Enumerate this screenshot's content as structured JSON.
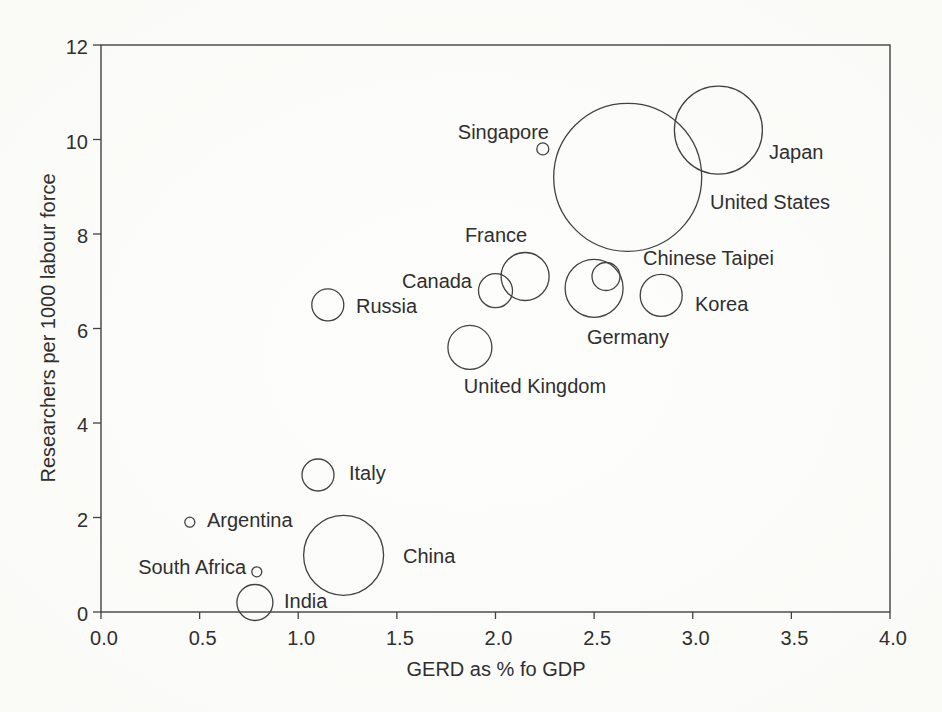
{
  "chart_data": {
    "type": "scatter",
    "variant": "bubble",
    "title": "",
    "xlabel": "GERD as % fo GDP",
    "ylabel": "Researchers per 1000 labour force",
    "xlim": [
      0.0,
      4.0
    ],
    "ylim": [
      0,
      12
    ],
    "grid": false,
    "legend": "none",
    "frame": true,
    "colors": {
      "stroke": "#424242",
      "text": "#2f2f2f",
      "background": "#fcfcfa"
    },
    "x_ticks": [
      {
        "v": 0.0,
        "label": "0.0"
      },
      {
        "v": 0.5,
        "label": "0.5"
      },
      {
        "v": 1.0,
        "label": "1.0"
      },
      {
        "v": 1.5,
        "label": "1.5"
      },
      {
        "v": 2.0,
        "label": "2.0"
      },
      {
        "v": 2.5,
        "label": "2.5"
      },
      {
        "v": 3.0,
        "label": "3.0"
      },
      {
        "v": 3.5,
        "label": "3.5"
      },
      {
        "v": 4.0,
        "label": "4.0"
      }
    ],
    "y_ticks": [
      {
        "v": 0,
        "label": "0"
      },
      {
        "v": 2,
        "label": "2"
      },
      {
        "v": 4,
        "label": "4"
      },
      {
        "v": 6,
        "label": "6"
      },
      {
        "v": 8,
        "label": "8"
      },
      {
        "v": 10,
        "label": "10"
      },
      {
        "v": 12,
        "label": "12"
      }
    ],
    "points": [
      {
        "name": "South Africa",
        "x": 0.79,
        "y": 0.85,
        "r_px": 5,
        "label_anchor": "end",
        "label_px": [
          246,
          567
        ]
      },
      {
        "name": "Argentina",
        "x": 0.45,
        "y": 1.9,
        "r_px": 5,
        "label_anchor": "start",
        "label_px": [
          207,
          520
        ]
      },
      {
        "name": "India",
        "x": 0.78,
        "y": 0.2,
        "r_px": 18,
        "label_anchor": "start",
        "label_px": [
          284,
          601
        ]
      },
      {
        "name": "China",
        "x": 1.23,
        "y": 1.2,
        "r_px": 40,
        "label_anchor": "start",
        "label_px": [
          403,
          556
        ]
      },
      {
        "name": "Italy",
        "x": 1.1,
        "y": 2.9,
        "r_px": 16,
        "label_anchor": "start",
        "label_px": [
          349,
          473
        ]
      },
      {
        "name": "Russia",
        "x": 1.15,
        "y": 6.5,
        "r_px": 16,
        "label_anchor": "start",
        "label_px": [
          356,
          306
        ]
      },
      {
        "name": "United Kingdom",
        "x": 1.87,
        "y": 5.6,
        "r_px": 22,
        "label_anchor": "middle",
        "label_px": [
          535,
          386
        ]
      },
      {
        "name": "Canada",
        "x": 2.0,
        "y": 6.8,
        "r_px": 17,
        "label_anchor": "end",
        "label_px": [
          472,
          281
        ]
      },
      {
        "name": "France",
        "x": 2.15,
        "y": 7.1,
        "r_px": 24,
        "label_anchor": "middle",
        "label_px": [
          496,
          235
        ]
      },
      {
        "name": "Germany",
        "x": 2.5,
        "y": 6.85,
        "r_px": 29,
        "label_anchor": "middle",
        "label_px": [
          628,
          337
        ]
      },
      {
        "name": "Chinese Taipei",
        "x": 2.56,
        "y": 7.1,
        "r_px": 14,
        "label_anchor": "start",
        "label_px": [
          643,
          258
        ]
      },
      {
        "name": "Korea",
        "x": 2.84,
        "y": 6.7,
        "r_px": 21,
        "label_anchor": "start",
        "label_px": [
          695,
          304
        ]
      },
      {
        "name": "Singapore",
        "x": 2.24,
        "y": 9.8,
        "r_px": 6,
        "label_anchor": "end",
        "label_px": [
          549,
          132
        ]
      },
      {
        "name": "United States",
        "x": 2.67,
        "y": 9.2,
        "r_px": 74,
        "label_anchor": "start",
        "label_px": [
          710,
          202
        ]
      },
      {
        "name": "Japan",
        "x": 3.13,
        "y": 10.2,
        "r_px": 44,
        "label_anchor": "start",
        "label_px": [
          769,
          152
        ]
      }
    ]
  }
}
